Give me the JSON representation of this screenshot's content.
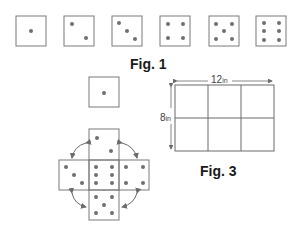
{
  "figures": {
    "fig1": {
      "caption": "Fig. 1",
      "dice_faces": [
        1,
        2,
        3,
        4,
        5,
        6
      ]
    },
    "fig2": {
      "single_face": 1,
      "net": {
        "top": 2,
        "left": 3,
        "center": 6,
        "right": 4,
        "bottom": 5
      },
      "rotation_arrows": 4
    },
    "fig3": {
      "caption": "Fig. 3",
      "width_label": "12",
      "width_unit": "in",
      "height_label": "8",
      "height_unit": "in",
      "grid_columns": 3,
      "grid_rows": 2
    }
  },
  "colors": {
    "stroke": "#6b6b6b",
    "pip": "#707070",
    "text": "#1a1a1a"
  }
}
